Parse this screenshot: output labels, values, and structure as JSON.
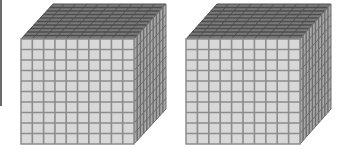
{
  "figure": {
    "cube_count": 2,
    "cubes": [
      {
        "id": "cube-1",
        "units_per_edge": 10,
        "front": {
          "x": 21,
          "y": 39,
          "width": 113,
          "height": 105
        },
        "depth": {
          "dx": 32,
          "dy": -35
        }
      },
      {
        "id": "cube-2",
        "units_per_edge": 10,
        "front": {
          "x": 186,
          "y": 39,
          "width": 114,
          "height": 105
        },
        "depth": {
          "dx": 31,
          "dy": -35
        }
      }
    ],
    "colors": {
      "front_fill": "#d8d8d8",
      "front_line": "#8c8c8c",
      "top_fill": "#7a7a7a",
      "top_line": "#4e4e4e",
      "side_fill": "#a8a8a8",
      "side_line": "#6c6c6c",
      "edge_line": "#6a6a6a"
    }
  }
}
